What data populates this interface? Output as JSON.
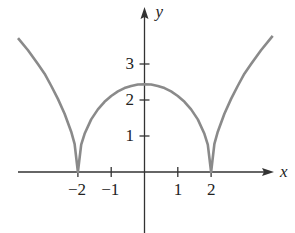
{
  "chart_data": {
    "type": "line",
    "title": "",
    "xlabel": "x",
    "ylabel": "y",
    "xlim": [
      -3.8,
      3.85
    ],
    "ylim": [
      -1.7,
      4.5
    ],
    "grid": false,
    "legend": null,
    "x_ticks": [
      -2,
      -1,
      1,
      2
    ],
    "x_tick_labels": [
      "−2",
      "−1",
      "1",
      "2"
    ],
    "y_ticks": [
      1,
      2,
      3
    ],
    "y_tick_labels": [
      "1",
      "2",
      "3"
    ],
    "series": [
      {
        "name": "curve",
        "description": "y = k*sqrt(|x^2 - 4|), cusps at x = -2 and x = 2, peak about 2.45 at x = 0",
        "x": [
          -3.8,
          -3.5,
          -3.2,
          -3.0,
          -2.8,
          -2.6,
          -2.4,
          -2.2,
          -2.1,
          -2.0,
          -1.9,
          -1.8,
          -1.6,
          -1.4,
          -1.2,
          -1.0,
          -0.8,
          -0.6,
          -0.4,
          -0.2,
          0.0,
          0.2,
          0.4,
          0.6,
          0.8,
          1.0,
          1.2,
          1.4,
          1.6,
          1.8,
          1.9,
          2.0,
          2.1,
          2.2,
          2.4,
          2.6,
          2.8,
          3.0,
          3.2,
          3.5,
          3.85
        ],
        "y": [
          3.72,
          3.38,
          3.0,
          2.73,
          2.39,
          2.03,
          1.62,
          1.12,
          0.78,
          0.0,
          0.76,
          1.06,
          1.46,
          1.74,
          1.95,
          2.11,
          2.24,
          2.33,
          2.39,
          2.43,
          2.44,
          2.43,
          2.39,
          2.33,
          2.24,
          2.11,
          1.95,
          1.74,
          1.46,
          1.06,
          0.76,
          0.0,
          0.78,
          1.12,
          1.62,
          2.03,
          2.39,
          2.73,
          3.0,
          3.38,
          3.78
        ]
      }
    ]
  },
  "style": {
    "curve_color": "#8a8a8a",
    "axis_color": "#333333"
  },
  "labels": {
    "x_axis": "x",
    "y_axis": "y"
  }
}
